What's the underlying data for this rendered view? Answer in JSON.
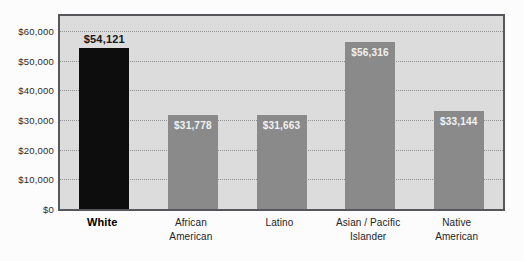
{
  "chart_data": {
    "type": "bar",
    "title": "",
    "subtitle": "",
    "xlabel": "",
    "ylabel": "",
    "grid": true,
    "legend": "none",
    "ylim": [
      0,
      65000
    ],
    "categories": [
      "White",
      "African American",
      "Latino",
      "Asian / Pacific Islander",
      "Native American"
    ],
    "category_lines": [
      [
        "White",
        ""
      ],
      [
        "African",
        "American"
      ],
      [
        "Latino",
        ""
      ],
      [
        "Asian / Pacific",
        "Islander"
      ],
      [
        "Native",
        "American"
      ]
    ],
    "values": [
      54121,
      31778,
      31663,
      56316,
      33144
    ],
    "value_labels": [
      "$54,121",
      "$31,778",
      "$31,663",
      "$56,316",
      "$33,144"
    ],
    "label_placement": [
      "above",
      "inside",
      "inside",
      "inside",
      "inside"
    ],
    "bar_styles": [
      "dark",
      "medium",
      "medium",
      "medium",
      "medium"
    ],
    "highlighted_category": "White",
    "yticks": [
      0,
      10000,
      20000,
      30000,
      40000,
      50000,
      60000
    ],
    "ytick_labels": [
      "$0",
      "$10,000",
      "$20,000",
      "$30,000",
      "$40,000",
      "$50,000",
      "$60,000"
    ],
    "colors": {
      "bar_dark": "#0d0d0e",
      "bar_medium": "#8a8a8a",
      "plot_background": "#dcdcdc",
      "page_background": "#fcfcfc",
      "frame": "#55575a",
      "gridline": "#8e9092",
      "label_dark_text": "#17181a",
      "label_light_text": "#f2f2f2"
    }
  }
}
